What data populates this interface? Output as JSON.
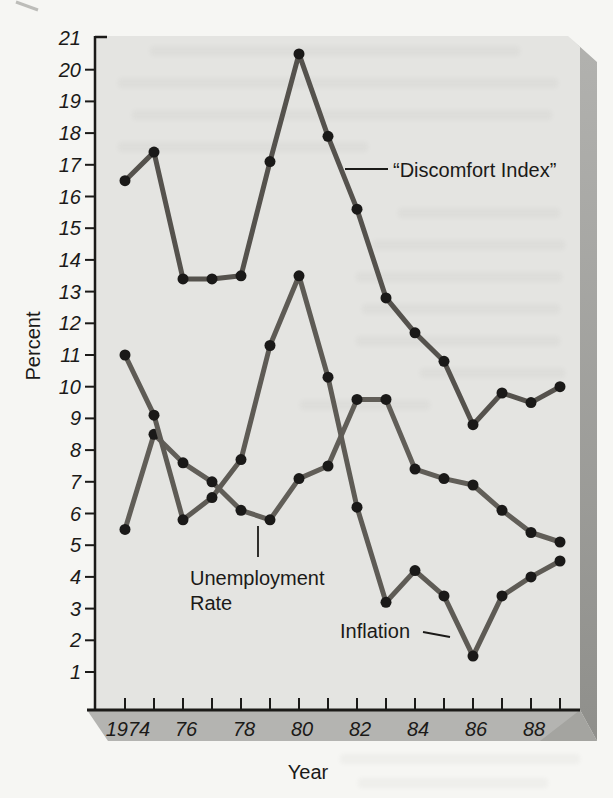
{
  "colors": {
    "page": "#f6f6f3",
    "face": "#e4e4e1",
    "side_top": "#b2b2af",
    "side_bottom": "#8f8f8b",
    "bottom_band": "#b4b4b1",
    "corner_shade": "#9c9c99",
    "axis": "#1b1a18",
    "dot": "#1a1918",
    "ghost": "#6a6a66"
  },
  "chart_data": {
    "type": "line",
    "title": "",
    "xlabel": "Year",
    "ylabel": "Percent",
    "x": [
      1974,
      1975,
      1976,
      1977,
      1978,
      1979,
      1980,
      1981,
      1982,
      1983,
      1984,
      1985,
      1986,
      1987,
      1988,
      1989
    ],
    "x_tick_labels": [
      "1974",
      "",
      "76",
      "",
      "78",
      "",
      "80",
      "",
      "82",
      "",
      "84",
      "",
      "86",
      "",
      "88",
      ""
    ],
    "ylim": [
      1,
      21
    ],
    "y_tick_step": 1,
    "y_tick_labels": [
      "1",
      "2",
      "3",
      "4",
      "5",
      "6",
      "7",
      "8",
      "9",
      "10",
      "11",
      "12",
      "13",
      "14",
      "15",
      "16",
      "17",
      "18",
      "19",
      "20",
      "21"
    ],
    "grid": false,
    "legend_position": "inline-annotations",
    "series": [
      {
        "id": "discomfort-index",
        "label": "“Discomfort Index”",
        "color": "#55524d",
        "values": [
          16.5,
          17.4,
          13.4,
          13.4,
          13.5,
          17.1,
          20.5,
          17.9,
          15.6,
          12.8,
          11.7,
          10.8,
          8.8,
          9.8,
          9.5,
          10.0
        ]
      },
      {
        "id": "unemployment-rate",
        "label_lines": [
          "Unemployment",
          "Rate"
        ],
        "color": "#615e58",
        "values": [
          5.5,
          8.5,
          7.6,
          7.0,
          6.1,
          5.8,
          7.1,
          7.5,
          9.6,
          9.6,
          7.4,
          7.1,
          6.9,
          6.1,
          5.4,
          5.1
        ]
      },
      {
        "id": "inflation",
        "label": "Inflation",
        "color": "#5e5b55",
        "values": [
          11.0,
          9.1,
          5.8,
          6.5,
          7.7,
          11.3,
          13.5,
          10.3,
          6.2,
          3.2,
          4.2,
          3.4,
          1.5,
          3.4,
          4.0,
          4.5
        ]
      }
    ]
  }
}
